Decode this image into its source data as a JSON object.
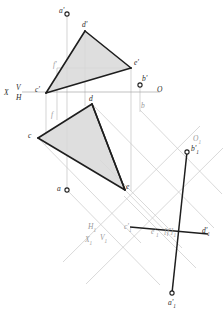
{
  "figure": {
    "type": "descriptive-geometry-orthographic-projection",
    "background_color": "#ffffff",
    "ink_color": "#222222",
    "construction_color": "#b9b9b9",
    "fill_color": "#d6d6d6",
    "label_color": "#555555"
  },
  "axes": {
    "ground_line": {
      "name": "X - O",
      "left_label": "X",
      "right_label": "O",
      "upper_half_label": "V",
      "lower_half_label": "H",
      "y": 92,
      "x_start": 22,
      "x_end": 160
    },
    "auxiliary_line": {
      "name": "X1 - O1",
      "left_label_x": "X",
      "left_label_x_sub": "1",
      "left_label_v": "V",
      "left_label_v_sub": "1",
      "left_label_h": "H",
      "left_label_h_sub": "1",
      "right_label": "O",
      "right_label_sub": "1"
    }
  },
  "points": {
    "a_prime": {
      "label": "a",
      "prime": "'",
      "sub": "",
      "x": 67,
      "y": 14,
      "marker": "circle"
    },
    "a": {
      "label": "a",
      "prime": "",
      "sub": "",
      "x": 67,
      "y": 190,
      "marker": "circle"
    },
    "b_prime": {
      "label": "b",
      "prime": "'",
      "sub": "",
      "x": 140,
      "y": 85,
      "marker": "circle"
    },
    "b": {
      "label": "b",
      "prime": "",
      "sub": "",
      "x": 140,
      "y": 110,
      "marker": "none"
    },
    "c_prime": {
      "label": "c",
      "prime": "'",
      "sub": "",
      "x": 46,
      "y": 93,
      "marker": "none"
    },
    "d_prime": {
      "label": "d",
      "prime": "'",
      "sub": "",
      "x": 85,
      "y": 31,
      "marker": "none"
    },
    "e_prime": {
      "label": "e",
      "prime": "'",
      "sub": "",
      "x": 131,
      "y": 68,
      "marker": "none"
    },
    "f_prime": {
      "label": "f",
      "prime": "'",
      "sub": "",
      "x": 63,
      "y": 68,
      "marker": "none"
    },
    "c": {
      "label": "c",
      "prime": "",
      "sub": "",
      "x": 38,
      "y": 138,
      "marker": "none"
    },
    "d": {
      "label": "d",
      "prime": "",
      "sub": "",
      "x": 92,
      "y": 104,
      "marker": "none"
    },
    "e": {
      "label": "e",
      "prime": "",
      "sub": "",
      "x": 125,
      "y": 190,
      "marker": "none"
    },
    "f": {
      "label": "f",
      "prime": "",
      "sub": "",
      "x": 57,
      "y": 117,
      "marker": "none"
    },
    "a1_prime": {
      "label": "a",
      "prime": "'",
      "sub": "1",
      "x": 172,
      "y": 293,
      "marker": "circle"
    },
    "b1_prime": {
      "label": "b",
      "prime": "'",
      "sub": "1",
      "x": 187,
      "y": 152,
      "marker": "circle"
    },
    "c1_prime": {
      "label": "c",
      "prime": "'",
      "sub": "1",
      "x": 130,
      "y": 228,
      "marker": "none"
    },
    "d1_prime": {
      "label": "d",
      "prime": "'",
      "sub": "1",
      "x": 205,
      "y": 232,
      "marker": "none"
    },
    "e1_prime": {
      "label": "e",
      "prime": "'",
      "sub": "1",
      "x": 156,
      "y": 230,
      "marker": "none"
    },
    "f1_prime": {
      "label": "[f",
      "prime": "']",
      "sub": "1",
      "x": 172,
      "y": 230,
      "marker": "none"
    }
  },
  "labels": [
    {
      "name": "label-a-prime",
      "text": "a",
      "prime": "'",
      "sub": "",
      "x": 59,
      "y": 8,
      "tone": "dark"
    },
    {
      "name": "label-d-prime",
      "text": "d",
      "prime": "'",
      "sub": "",
      "x": 83,
      "y": 22,
      "tone": "dark"
    },
    {
      "name": "label-e-prime",
      "text": "e",
      "prime": "'",
      "sub": "",
      "x": 134,
      "y": 60,
      "tone": "dark"
    },
    {
      "name": "label-f-prime",
      "text": "f",
      "prime": "'",
      "sub": "",
      "x": 53,
      "y": 62,
      "tone": "light"
    },
    {
      "name": "label-b-prime",
      "text": "b",
      "prime": "'",
      "sub": "",
      "x": 142,
      "y": 76,
      "tone": "dark"
    },
    {
      "name": "label-c-prime",
      "text": "c",
      "prime": "'",
      "sub": "",
      "x": 36,
      "y": 87,
      "tone": "dark"
    },
    {
      "name": "label-x",
      "text": "X",
      "prime": "",
      "sub": "",
      "x": 4,
      "y": 89,
      "tone": "dark"
    },
    {
      "name": "label-v",
      "text": "V",
      "prime": "",
      "sub": "",
      "x": 16,
      "y": 85,
      "tone": "dark"
    },
    {
      "name": "label-h",
      "text": "H",
      "prime": "",
      "sub": "",
      "x": 16,
      "y": 94,
      "tone": "dark"
    },
    {
      "name": "label-o",
      "text": "O",
      "prime": "",
      "sub": "",
      "x": 157,
      "y": 87,
      "tone": "dark"
    },
    {
      "name": "label-d",
      "text": "d",
      "prime": "",
      "sub": "",
      "x": 90,
      "y": 96,
      "tone": "dark"
    },
    {
      "name": "label-b",
      "text": "b",
      "prime": "",
      "sub": "",
      "x": 141,
      "y": 103,
      "tone": "light"
    },
    {
      "name": "label-f",
      "text": "f",
      "prime": "",
      "sub": "",
      "x": 51,
      "y": 112,
      "tone": "light"
    },
    {
      "name": "label-c",
      "text": "c",
      "prime": "",
      "sub": "",
      "x": 29,
      "y": 133,
      "tone": "dark"
    },
    {
      "name": "label-o1",
      "text": "O",
      "prime": "",
      "sub": "1",
      "x": 194,
      "y": 136,
      "tone": "light"
    },
    {
      "name": "label-b1-prime",
      "text": "b",
      "prime": "'",
      "sub": "1",
      "x": 192,
      "y": 146,
      "tone": "dark"
    },
    {
      "name": "label-a",
      "text": "a",
      "prime": "",
      "sub": "",
      "x": 58,
      "y": 186,
      "tone": "dark"
    },
    {
      "name": "label-e",
      "text": "e",
      "prime": "",
      "sub": "",
      "x": 126,
      "y": 184,
      "tone": "dark"
    },
    {
      "name": "label-h1",
      "text": "H",
      "prime": "",
      "sub": "1",
      "x": 89,
      "y": 224,
      "tone": "light"
    },
    {
      "name": "label-c1-prime",
      "text": "c",
      "prime": "'",
      "sub": "1",
      "x": 125,
      "y": 224,
      "tone": "light"
    },
    {
      "name": "label-e1-prime",
      "text": "e",
      "prime": "'",
      "sub": "1",
      "x": 152,
      "y": 229,
      "tone": "light"
    },
    {
      "name": "label-f1-prime",
      "text": "[f",
      "prime": "']",
      "sub": "1",
      "x": 165,
      "y": 229,
      "tone": "light"
    },
    {
      "name": "label-d1-prime",
      "text": "d",
      "prime": "'",
      "sub": "1",
      "x": 203,
      "y": 228,
      "tone": "dark"
    },
    {
      "name": "label-x1",
      "text": "X",
      "prime": "",
      "sub": "1",
      "x": 86,
      "y": 237,
      "tone": "light"
    },
    {
      "name": "label-v1",
      "text": "V",
      "prime": "",
      "sub": "1",
      "x": 101,
      "y": 235,
      "tone": "light"
    },
    {
      "name": "label-a1-prime",
      "text": "a",
      "prime": "'",
      "sub": "1",
      "x": 169,
      "y": 300,
      "tone": "dark"
    }
  ],
  "shapes": {
    "triangle_front": {
      "name": "triangle-c-d-e-front",
      "vertices": "46,93 85,31 131,68"
    },
    "triangle_top": {
      "name": "triangle-c-d-e-top",
      "vertices": "38,138 92,104 125,190"
    },
    "line_ab_front": {
      "name": "line-a-prime-b-prime"
    },
    "line_ab_aux": {
      "name": "line-a1-prime-b1-prime"
    },
    "line_cde_aux": {
      "name": "edge-view-c1-d1"
    }
  }
}
